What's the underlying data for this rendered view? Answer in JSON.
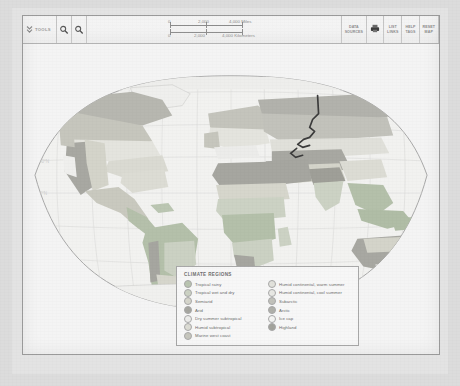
{
  "toolbar": {
    "tools_label": "TOOLS",
    "chevron_icon": "double-chevron-down",
    "zoom_in_icon": "magnifier-plus-icon",
    "zoom_out_icon": "magnifier-minus-icon",
    "buttons": [
      {
        "name": "data-sources",
        "line1": "DATA",
        "line2": "SOURCES"
      },
      {
        "name": "print",
        "line1": "",
        "line2": ""
      },
      {
        "name": "list-links",
        "line1": "LIST",
        "line2": "LINKS"
      },
      {
        "name": "help-tags",
        "line1": "HELP",
        "line2": "TAGS"
      },
      {
        "name": "reset-map",
        "line1": "RESET",
        "line2": "MAP"
      }
    ],
    "print_icon": "printer-icon",
    "links_icon": "links-icon"
  },
  "scalebar": {
    "miles": {
      "start": "0",
      "mid": "2,000",
      "end": "4,000 Miles"
    },
    "kilometers": {
      "start": "0",
      "mid": "2,000",
      "end": "4,000 Kilometers"
    }
  },
  "map": {
    "ocean_color": "#f4f4f4",
    "graticule_color": "#d8d8d8",
    "outline_color": "#9e9e9e",
    "annotation_color": "#3a3a3a",
    "lat_labels": [
      "80°N",
      "60°N",
      "40°N",
      "20°N",
      "0°",
      "20°S",
      "40°S",
      "60°S"
    ],
    "lon_labels": [
      "180°",
      "150°W",
      "120°W",
      "90°W",
      "60°W",
      "30°W",
      "0°",
      "30°E",
      "60°E",
      "90°E",
      "120°E",
      "150°E",
      "180°"
    ]
  },
  "legend": {
    "title": "CLIMATE REGIONS",
    "column_left": [
      {
        "label": "Tropical rainy",
        "color": "#b9c4b0"
      },
      {
        "label": "Tropical wet and dry",
        "color": "#ccd2c4"
      },
      {
        "label": "Semiarid",
        "color": "#d6d6cc"
      },
      {
        "label": "Arid",
        "color": "#a6a6a0"
      },
      {
        "label": "Dry summer subtropical",
        "color": "#ececea"
      },
      {
        "label": "Humid subtropical",
        "color": "#dcdcd4"
      },
      {
        "label": "Marine west coast",
        "color": "#c6c6bd"
      }
    ],
    "column_right": [
      {
        "label": "Humid continental, warm summer",
        "color": "#e2e2dc"
      },
      {
        "label": "Humid continental, cool summer",
        "color": "#e8e8e4"
      },
      {
        "label": "Subarctic",
        "color": "#c2c2bb"
      },
      {
        "label": "Arctic",
        "color": "#b0b0aa"
      },
      {
        "label": "Ice cap",
        "color": "#f4f4f2"
      },
      {
        "label": "Highland",
        "color": "#a3a39c"
      }
    ]
  }
}
